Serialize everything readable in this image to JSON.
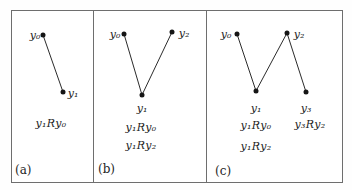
{
  "figure": {
    "panels": [
      {
        "letter": "(a)",
        "nodes": {
          "y0": "y₀",
          "y1": "y₁"
        },
        "edges": [
          "y0–y1"
        ],
        "relations": [
          "y₁Ry₀"
        ]
      },
      {
        "letter": "(b)",
        "nodes": {
          "y0": "y₀",
          "y1": "y₁",
          "y2": "y₂"
        },
        "edges": [
          "y0–y1",
          "y2–y1"
        ],
        "relations": [
          "y₁Ry₀",
          "y₁Ry₂"
        ]
      },
      {
        "letter": "(c)",
        "nodes": {
          "y0": "y₀",
          "y1": "y₁",
          "y2": "y₂",
          "y3": "y₃"
        },
        "edges": [
          "y0–y1",
          "y2–y1",
          "y2–y3"
        ],
        "relations": [
          "y₁Ry₀",
          "y₃Ry₂",
          "y₁Ry₂"
        ]
      }
    ],
    "colors": {
      "background": "#ffffff",
      "ink": "#1e1e1e",
      "frame": "#6e6e6e"
    }
  }
}
